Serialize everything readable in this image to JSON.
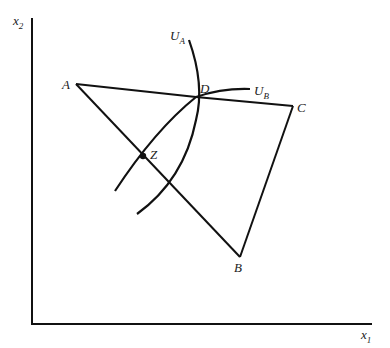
{
  "axes": {
    "x_label": "x",
    "x_sub": "1",
    "y_label": "x",
    "y_sub": "2"
  },
  "points": {
    "A": "A",
    "B": "B",
    "C": "C",
    "D": "D",
    "Z": "Z"
  },
  "curves": {
    "UA": {
      "label": "U",
      "sub": "A"
    },
    "UB": {
      "label": "U",
      "sub": "B"
    }
  },
  "colors": {
    "line": "#111111",
    "background": "#ffffff"
  }
}
